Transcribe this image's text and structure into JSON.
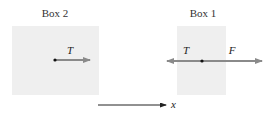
{
  "box2": {
    "title": "Box 2",
    "force_label": "T",
    "fill": "#efefef"
  },
  "box1": {
    "title": "Box 1",
    "left_force_label": "T",
    "right_force_label": "F",
    "fill": "#efefef"
  },
  "axis": {
    "label": "x"
  },
  "colors": {
    "force_arrow": "#8a8a8a",
    "axis": "#222222",
    "point": "#111111"
  }
}
